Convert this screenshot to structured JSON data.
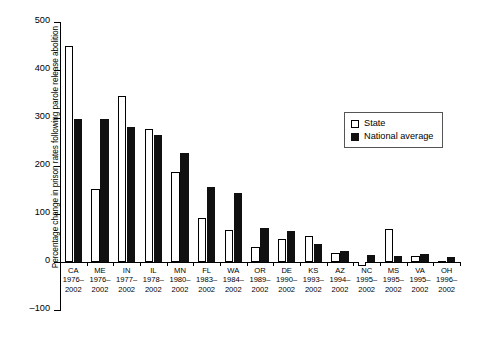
{
  "chart_data": {
    "type": "bar",
    "title": "",
    "xlabel": "",
    "ylabel": "Percentage change in prison rates following parole release abolition",
    "ylim": [
      -100,
      500
    ],
    "yticks": [
      -100,
      0,
      100,
      200,
      300,
      400,
      500
    ],
    "ytick_labels": [
      "–100",
      "0",
      "100",
      "200",
      "300",
      "400",
      "500"
    ],
    "grid": false,
    "legend_position": "upper right",
    "categories": [
      "CA",
      "ME",
      "IN",
      "IL",
      "MN",
      "FL",
      "WA",
      "OR",
      "DE",
      "KS",
      "AZ",
      "NC",
      "MS",
      "VA",
      "OH"
    ],
    "period_start": [
      "1976–",
      "1976–",
      "1977–",
      "1978–",
      "1980–",
      "1983–",
      "1984–",
      "1989–",
      "1990–",
      "1993–",
      "1994–",
      "1995–",
      "1995–",
      "1995–",
      "1996–"
    ],
    "period_end": [
      "2002",
      "2002",
      "2002",
      "2002",
      "2002",
      "2002",
      "2002",
      "2002",
      "2002",
      "2002",
      "2002",
      "2002",
      "2002",
      "2002",
      "2002"
    ],
    "series": [
      {
        "name": "State",
        "color": "#ffffff",
        "values": [
          450,
          152,
          345,
          278,
          188,
          92,
          67,
          32,
          48,
          55,
          18,
          -8,
          68,
          13,
          3
        ]
      },
      {
        "name": "National average",
        "color": "#101010",
        "values": [
          298,
          297,
          282,
          265,
          228,
          157,
          144,
          71,
          64,
          38,
          22,
          14,
          13,
          16,
          10
        ]
      }
    ]
  },
  "legend": {
    "items": [
      {
        "label": "State",
        "swatch": "open-square"
      },
      {
        "label": "National average",
        "swatch": "filled-square"
      }
    ]
  }
}
